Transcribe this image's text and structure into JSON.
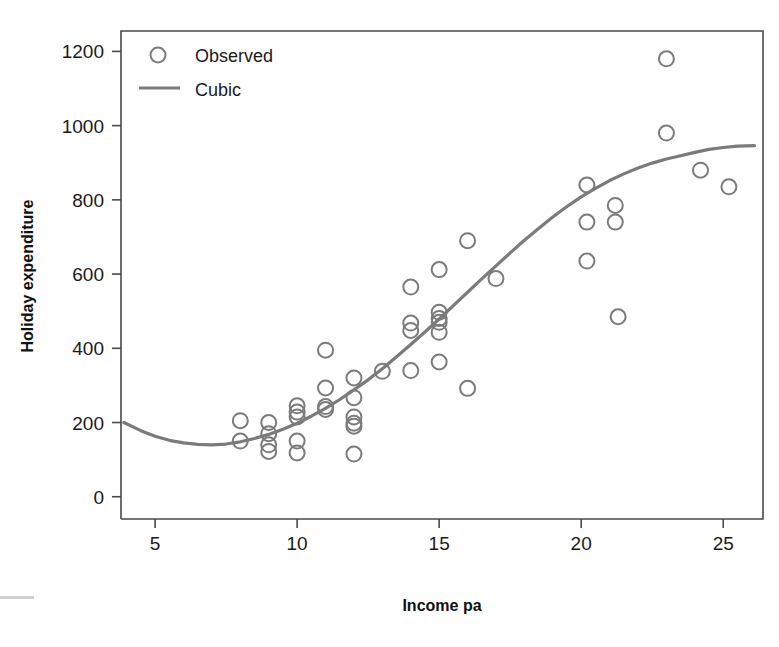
{
  "chart_data": {
    "type": "scatter",
    "title": "",
    "xlabel": "Income pa",
    "ylabel": "Holiday expenditure",
    "xlim": [
      3.8,
      26.4
    ],
    "ylim": [
      -60,
      1255
    ],
    "xticks": [
      5,
      10,
      15,
      20,
      25
    ],
    "yticks": [
      0,
      200,
      400,
      600,
      800,
      1000,
      1200
    ],
    "grid": false,
    "legend_position": "top-left",
    "series": [
      {
        "name": "Observed",
        "type": "scatter",
        "marker": "open-circle",
        "color": "#7b7b7b",
        "points": [
          [
            8.0,
            205
          ],
          [
            8.0,
            150
          ],
          [
            9.0,
            200
          ],
          [
            9.0,
            170
          ],
          [
            9.0,
            140
          ],
          [
            9.0,
            122
          ],
          [
            10.0,
            245
          ],
          [
            10.0,
            228
          ],
          [
            10.0,
            215
          ],
          [
            10.0,
            150
          ],
          [
            10.0,
            118
          ],
          [
            11.0,
            395
          ],
          [
            11.0,
            293
          ],
          [
            11.0,
            243
          ],
          [
            11.0,
            235
          ],
          [
            12.0,
            320
          ],
          [
            12.0,
            267
          ],
          [
            12.0,
            215
          ],
          [
            12.0,
            198
          ],
          [
            12.0,
            190
          ],
          [
            12.0,
            115
          ],
          [
            13.0,
            338
          ],
          [
            14.0,
            565
          ],
          [
            14.0,
            468
          ],
          [
            14.0,
            448
          ],
          [
            14.0,
            340
          ],
          [
            15.0,
            612
          ],
          [
            15.0,
            497
          ],
          [
            15.0,
            480
          ],
          [
            15.0,
            470
          ],
          [
            15.0,
            443
          ],
          [
            15.0,
            363
          ],
          [
            16.0,
            690
          ],
          [
            16.0,
            292
          ],
          [
            17.0,
            588
          ],
          [
            20.2,
            840
          ],
          [
            20.2,
            740
          ],
          [
            20.2,
            635
          ],
          [
            21.2,
            785
          ],
          [
            21.2,
            740
          ],
          [
            21.3,
            485
          ],
          [
            23.0,
            1180
          ],
          [
            23.0,
            980
          ],
          [
            24.2,
            880
          ],
          [
            25.2,
            835
          ]
        ]
      },
      {
        "name": "Cubic",
        "type": "line",
        "color": "#7b7b7b",
        "fit": "cubic",
        "curve_points": [
          [
            3.9,
            200
          ],
          [
            4.5,
            178
          ],
          [
            5.0,
            163
          ],
          [
            5.5,
            152
          ],
          [
            6.0,
            145
          ],
          [
            6.5,
            141
          ],
          [
            7.0,
            140
          ],
          [
            7.5,
            142
          ],
          [
            8.0,
            148
          ],
          [
            8.5,
            157
          ],
          [
            9.0,
            168
          ],
          [
            9.5,
            182
          ],
          [
            10.0,
            198
          ],
          [
            10.5,
            217
          ],
          [
            11.0,
            238
          ],
          [
            11.5,
            262
          ],
          [
            12.0,
            288
          ],
          [
            12.5,
            315
          ],
          [
            13.0,
            345
          ],
          [
            13.5,
            377
          ],
          [
            14.0,
            410
          ],
          [
            14.5,
            444
          ],
          [
            15.0,
            479
          ],
          [
            15.5,
            515
          ],
          [
            16.0,
            551
          ],
          [
            16.5,
            587
          ],
          [
            17.0,
            622
          ],
          [
            17.5,
            657
          ],
          [
            18.0,
            691
          ],
          [
            18.5,
            723
          ],
          [
            19.0,
            754
          ],
          [
            19.5,
            782
          ],
          [
            20.0,
            808
          ],
          [
            20.5,
            831
          ],
          [
            21.0,
            852
          ],
          [
            21.5,
            870
          ],
          [
            22.0,
            886
          ],
          [
            22.5,
            899
          ],
          [
            23.0,
            910
          ],
          [
            23.5,
            919
          ],
          [
            24.0,
            928
          ],
          [
            24.5,
            936
          ],
          [
            25.0,
            941
          ],
          [
            25.5,
            945
          ],
          [
            26.1,
            946
          ]
        ]
      }
    ],
    "legend": [
      {
        "label": "Observed",
        "marker": "open-circle"
      },
      {
        "label": "Cubic",
        "marker": "line"
      }
    ]
  },
  "axes": {
    "x_title": "Income pa",
    "y_title": "Holiday expenditure",
    "x_tick_labels": [
      "5",
      "10",
      "15",
      "20",
      "25"
    ],
    "y_tick_labels": [
      "0",
      "200",
      "400",
      "600",
      "800",
      "1000",
      "1200"
    ]
  },
  "legend": {
    "observed_label": "Observed",
    "cubic_label": "Cubic"
  },
  "colors": {
    "data": "#7b7b7b",
    "axis": "#4a4a4a",
    "text": "#1a1a1a",
    "background": "#ffffff"
  }
}
